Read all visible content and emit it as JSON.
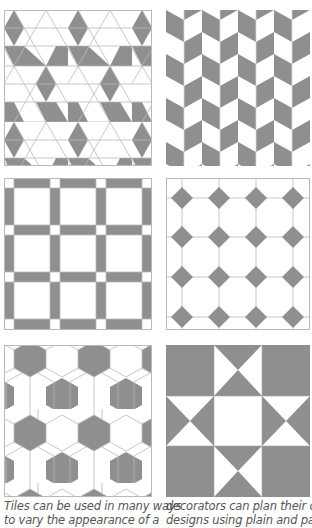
{
  "colors": {
    "tile_gray": "#8f8f8f",
    "tile_white": "#ffffff",
    "grout": "#b9b9b9",
    "caption_text": "#555555"
  },
  "panels": [
    {
      "id": "tumbling-blocks",
      "label": "Rhombus star/cube tiling with gray diamonds and gray horizontal bands"
    },
    {
      "id": "herringbone-chevron",
      "label": "Vertical chevron columns alternating gray and white"
    },
    {
      "id": "square-lattice",
      "label": "White squares framed by gray bars with white corner squares"
    },
    {
      "id": "octagon-diamond",
      "label": "White octagons with small gray diamond insets"
    },
    {
      "id": "woven-hexagon",
      "label": "Interlaced white strips around gray hexagons"
    },
    {
      "id": "star-quilt",
      "label": "Eight-point star quilt block of gray and white triangles"
    }
  ],
  "captions": {
    "left_line1": "Tiles can be used in many ways",
    "left_line2": "to vary the appearance of a",
    "right_line1": "decorators can plan their own",
    "right_line2": "designs using plain and patterned"
  }
}
